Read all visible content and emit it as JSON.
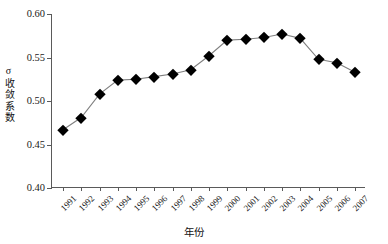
{
  "chart_data": {
    "type": "line",
    "title": "",
    "xlabel": "年份",
    "ylabel": "σ收敛系数",
    "ylim": [
      0.4,
      0.6
    ],
    "ytick_labels": [
      "0.60",
      "0.55",
      "0.50",
      "0.45",
      "0.40"
    ],
    "ytick_values": [
      0.6,
      0.55,
      0.5,
      0.45,
      0.4
    ],
    "grid": false,
    "legend": "none",
    "marker": "filled-diamond",
    "line_color": "#808080",
    "marker_color": "#000000",
    "categories": [
      "1991",
      "1992",
      "1993",
      "1994",
      "1995",
      "1996",
      "1997",
      "1998",
      "1999",
      "2000",
      "2001",
      "2002",
      "2003",
      "2004",
      "2005",
      "2006",
      "2007"
    ],
    "values": [
      0.467,
      0.481,
      0.508,
      0.524,
      0.525,
      0.528,
      0.531,
      0.536,
      0.552,
      0.57,
      0.571,
      0.573,
      0.577,
      0.572,
      0.548,
      0.544,
      0.533
    ],
    "series": [
      {
        "name": "σ收敛系数",
        "values": [
          0.467,
          0.481,
          0.508,
          0.524,
          0.525,
          0.528,
          0.531,
          0.536,
          0.552,
          0.57,
          0.571,
          0.573,
          0.577,
          0.572,
          0.548,
          0.544,
          0.533
        ]
      }
    ]
  }
}
